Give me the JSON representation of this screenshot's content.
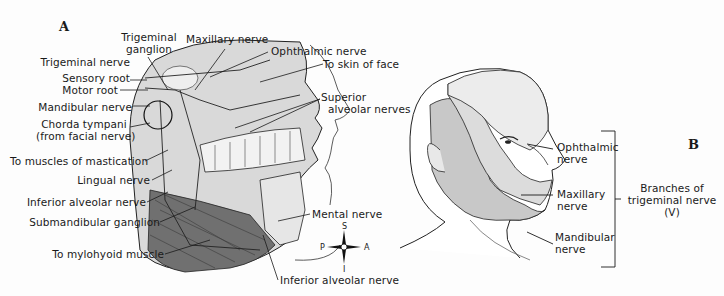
{
  "figure": {
    "panel_a": {
      "letter": "A",
      "labels": {
        "trigeminal_ganglion_1": "Trigeminal",
        "trigeminal_ganglion_2": "ganglion",
        "maxillary_nerve": "Maxillary nerve",
        "ophthalmic_nerve": "Ophthalmic nerve",
        "to_skin_of_face": "To skin of face",
        "trigeminal_nerve": "Trigeminal nerve",
        "sensory_root": "Sensory root",
        "motor_root": "Motor root",
        "mandibular_nerve": "Mandibular nerve",
        "chorda_tympani_1": "Chorda tympani",
        "chorda_tympani_2": "(from facial nerve)",
        "superior_alveolar_1": "Superior",
        "superior_alveolar_2": "alveolar nerves",
        "to_muscles_of_mastication": "To muscles of mastication",
        "lingual_nerve": "Lingual nerve",
        "inferior_alveolar_nerve_left": "Inferior alveolar nerve",
        "submandibular_ganglion": "Submandibular ganglion",
        "mental_nerve": "Mental nerve",
        "to_mylohyoid_muscle": "To mylohyoid muscle",
        "inferior_alveolar_nerve_bottom": "Inferior alveolar nerve"
      },
      "compass": {
        "s": "S",
        "i": "I",
        "p": "P",
        "a": "A"
      }
    },
    "panel_b": {
      "letter": "B",
      "labels": {
        "ophthalmic_1": "Ophthalmic",
        "ophthalmic_2": "nerve",
        "maxillary_1": "Maxillary",
        "maxillary_2": "nerve",
        "mandibular_1": "Mandibular",
        "mandibular_2": "nerve",
        "branches_1": "Branches of",
        "branches_2": "trigeminal nerve",
        "branches_3": "(V)"
      }
    },
    "colors": {
      "ophthalmic_region": "#ebebeb",
      "maxillary_region": "#dcdcdc",
      "mandibular_region": "#c4c4c4",
      "muscle": "#6a6a6a",
      "line": "#1a1a1a"
    }
  }
}
